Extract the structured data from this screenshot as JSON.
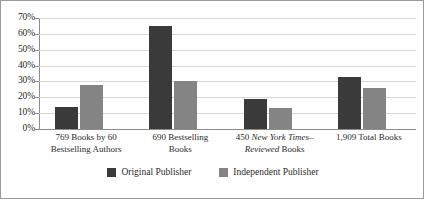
{
  "chart_data": {
    "type": "bar",
    "title": "",
    "subtitle": "",
    "xlabel": "",
    "ylabel": "",
    "ylim": [
      0,
      70
    ],
    "ytick_values": [
      70,
      60,
      50,
      40,
      30,
      20,
      10,
      0
    ],
    "ytick_labels": [
      "70%",
      "60%",
      "50%",
      "40%",
      "30%",
      "20%",
      "10%",
      "0%"
    ],
    "grid": "horizontal",
    "legend_position": "bottom-center",
    "categories": [
      "769 Books by 60 Bestselling Authors",
      "690 Bestselling Books",
      "450 New York Times–Reviewed Books",
      "1,909 Total Books"
    ],
    "category_label_parts": [
      [
        {
          "text": "769 Books by 60",
          "italic": false
        },
        {
          "text": "Bestselling Authors",
          "italic": false
        }
      ],
      [
        {
          "text": "690 Bestselling",
          "italic": false
        },
        {
          "text": "Books",
          "italic": false
        }
      ],
      [
        {
          "text": "450 ",
          "italic": false
        },
        {
          "text": "New York Times–",
          "italic": true
        },
        {
          "text": "Reviewed",
          "italic": true
        },
        {
          "text": " Books",
          "italic": false
        }
      ],
      [
        {
          "text": "1,909 Total Books",
          "italic": false
        }
      ]
    ],
    "series": [
      {
        "name": "Original Publisher",
        "color": "#3a3a3a",
        "values": [
          14,
          65,
          19,
          33
        ]
      },
      {
        "name": "Independent Publisher",
        "color": "#848484",
        "values": [
          28,
          30,
          13,
          26
        ]
      }
    ]
  },
  "legend": {
    "items": [
      {
        "label": "Original Publisher",
        "color": "#3a3a3a"
      },
      {
        "label": "Independent Publisher",
        "color": "#848484"
      }
    ]
  },
  "axis": {
    "y_labels": [
      "70%",
      "60%",
      "50%",
      "40%",
      "30%",
      "20%",
      "10%",
      "0%"
    ]
  },
  "categories_line1": [
    "769 Books by 60",
    "690 Bestselling",
    "450 ",
    "1,909 Total Books"
  ],
  "categories_line2": [
    "Bestselling Authors",
    "Books",
    "Reviewed Books",
    ""
  ],
  "nyt_italic": "New York Times–",
  "nyt_italic_2": "Reviewed",
  "nyt_tail": " Books"
}
